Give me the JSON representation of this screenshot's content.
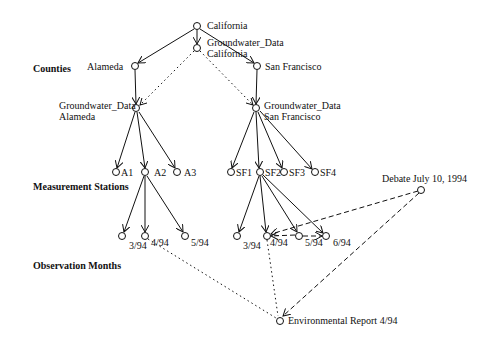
{
  "levels": {
    "counties": "Counties",
    "stations": "Measurement Stations",
    "months": "Observation Months"
  },
  "nodes": {
    "california": "California",
    "gw_california_1": "Groundwater_Data",
    "gw_california_2": "California",
    "alameda": "Alameda",
    "san_francisco": "San Francisco",
    "gw_alameda_1": "Groundwater_Data",
    "gw_alameda_2": "Alameda",
    "gw_sf_1": "Groundwater_Data",
    "gw_sf_2": "San Francisco",
    "a1": "A1",
    "a2": "A2",
    "a3": "A3",
    "sf1": "SF1",
    "sf2": "SF2",
    "sf3": "SF3",
    "sf4": "SF4",
    "a2_m3": "3/94",
    "a2_m4": "4/94",
    "a2_m5": "5/94",
    "sf2_m3": "3/94",
    "sf2_m4": "4/94",
    "sf2_m5": "5/94",
    "sf2_m6": "6/94",
    "debate": "Debate July 10, 1994",
    "env_report": "Environmental Report 4/94"
  },
  "colors": {
    "line": "#111111",
    "background": "#ffffff"
  }
}
